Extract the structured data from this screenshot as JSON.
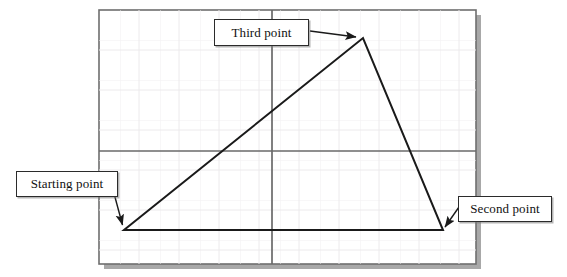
{
  "figure": {
    "type": "cad-drawing-annotated-diagram",
    "background_color": "#ffffff",
    "frame": {
      "name": "drawing-area-frame",
      "x": 99,
      "y": 10,
      "width": 377,
      "height": 254,
      "border_color": "#6e6e6e",
      "fill_color": "#ffffff",
      "shadow_color": "#a8a8a8",
      "shadow_offset": 5
    },
    "grid": {
      "visible": true,
      "line_color": "#f0eef0",
      "spacing_x": 40,
      "spacing_y": 40
    },
    "axes": {
      "horizontal_y": 151,
      "vertical_x": 272,
      "color": "#6a6a6a",
      "width": 1.6
    },
    "shape": {
      "name": "triangle",
      "stroke_color": "#1a1a1a",
      "stroke_width": 2,
      "fill": "none",
      "vertices": [
        {
          "label": "Starting point",
          "x": 124,
          "y": 230
        },
        {
          "label": "Second point",
          "x": 443,
          "y": 230
        },
        {
          "label": "Third point",
          "x": 363,
          "y": 38
        }
      ]
    },
    "annotations": [
      {
        "id": "third-point",
        "label": "Third point",
        "box": {
          "x": 214,
          "y": 19,
          "width": 95,
          "height": 27
        },
        "leader": {
          "x1": 310,
          "y1": 31,
          "x2": 357,
          "y2": 37
        },
        "arrow_target": "Third point"
      },
      {
        "id": "starting-point",
        "label": "Starting point",
        "box": {
          "x": 16,
          "y": 171,
          "width": 102,
          "height": 26
        },
        "leader": {
          "x1": 112,
          "y1": 186,
          "x2": 122,
          "y2": 226
        },
        "arrow_target": "Starting point"
      },
      {
        "id": "second-point",
        "label": "Second point",
        "box": {
          "x": 458,
          "y": 196,
          "width": 94,
          "height": 26
        },
        "leader": {
          "x1": 459,
          "y1": 207,
          "x2": 444,
          "y2": 228
        },
        "arrow_target": "Second point"
      }
    ]
  },
  "colors": {
    "ink": "#1a1a1a",
    "frame_border": "#6e6e6e",
    "frame_shadow": "#a8a8a8",
    "axis": "#6a6a6a",
    "grid": "#f0eef0",
    "callout_border": "#2b2b2b",
    "callout_fill": "#ffffff"
  }
}
